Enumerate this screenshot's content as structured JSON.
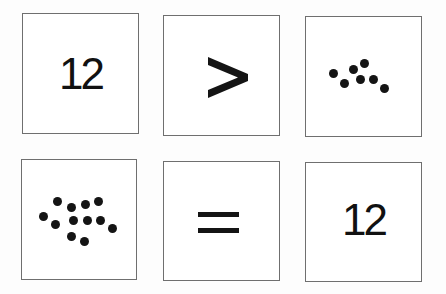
{
  "cards": [
    {
      "type": "numeral",
      "value": "12"
    },
    {
      "type": "symbol",
      "value": ">",
      "name": "greater-than"
    },
    {
      "type": "dots",
      "count": 7
    },
    {
      "type": "dots",
      "count": 12
    },
    {
      "type": "symbol",
      "value": "=",
      "name": "equals"
    },
    {
      "type": "numeral",
      "value": "12"
    }
  ],
  "colors": {
    "ink": "#141414",
    "border": "#6f6f6f",
    "background": "#ffffff"
  }
}
